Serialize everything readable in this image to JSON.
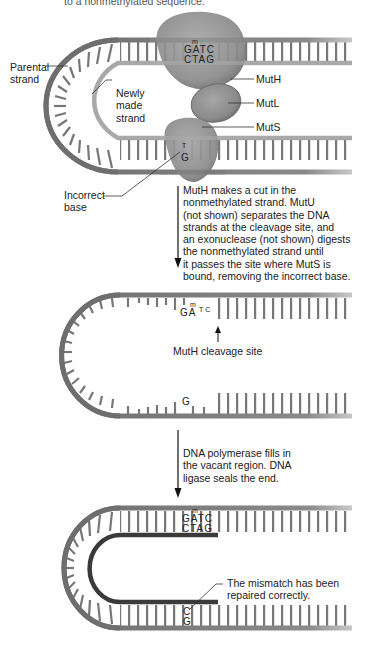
{
  "header": {
    "partial_caption": "to a nonmethylated sequence."
  },
  "panel1": {
    "labels": {
      "parental_strand": "Parental\nstrand",
      "newly_made_strand": "Newly\nmade\nstrand",
      "incorrect_base": "Incorrect\nbase",
      "muth": "MutH",
      "mutl": "MutL",
      "muts": "MutS"
    },
    "top_sequence": {
      "methyl_mark": "m",
      "strand_top": "GATC",
      "strand_bottom": "CTAG"
    },
    "mismatch": {
      "top": "T",
      "bottom": "G"
    }
  },
  "step1": {
    "text": "MutH makes a cut in the\nnonmethylated strand. MutU\n(not shown) separates the DNA\nstrands at the cleavage site, and\nan exonuclease (not shown) digests\nthe nonmethylated strand until\nit passes the site where MutS is\nbound, removing the incorrect base."
  },
  "panel2": {
    "labels": {
      "cleavage_site": "MutH cleavage site"
    },
    "top_sequence": {
      "methyl_mark": "m",
      "left": "GA",
      "right": "TC"
    },
    "bottom_base": "G"
  },
  "step2": {
    "text": "DNA polymerase fills in\nthe vacant region. DNA\nligase seals the end."
  },
  "panel3": {
    "labels": {
      "repaired": "The mismatch has been\nrepaired correctly."
    },
    "top_sequence": {
      "methyl_mark": "m",
      "strand_top": "GATC",
      "strand_bottom": "CTAG"
    },
    "repaired_pair": {
      "top": "C",
      "bottom": "G"
    }
  },
  "colors": {
    "parental_strand": "#6e6e6e",
    "new_strand": "#a9a9a9",
    "repaired_new_strand": "#3a3a3a",
    "protein": "#8c8c8c",
    "text": "#222222"
  }
}
